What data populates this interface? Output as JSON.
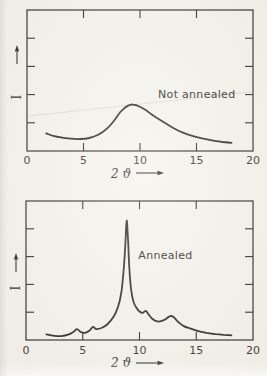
{
  "page": {
    "paper_color": "#f5f3ec",
    "ink_color": "#2b2927",
    "text_color": "#35332e"
  },
  "chart_data": [
    {
      "type": "line",
      "title": "Not annealed",
      "xlabel": "2 ϑ",
      "ylabel": "I",
      "xlim": [
        0,
        20
      ],
      "ylim": [
        0,
        1
      ],
      "grid": false,
      "legend": "none",
      "xticks_labeled": [
        0,
        5,
        10,
        15,
        20
      ],
      "xticks_inner": [
        5,
        10,
        15
      ],
      "ytick_fracs": [
        0.2,
        0.4,
        0.6,
        0.8
      ],
      "annotation": {
        "text": "Not annealed",
        "x": 11.6,
        "y_frac": 0.376
      },
      "points": [
        [
          1.7,
          0.125
        ],
        [
          2.4,
          0.105
        ],
        [
          3.1,
          0.095
        ],
        [
          3.9,
          0.087
        ],
        [
          4.7,
          0.085
        ],
        [
          5.5,
          0.092
        ],
        [
          6.3,
          0.115
        ],
        [
          7.1,
          0.16
        ],
        [
          7.7,
          0.215
        ],
        [
          8.3,
          0.28
        ],
        [
          8.9,
          0.32
        ],
        [
          9.4,
          0.33
        ],
        [
          9.9,
          0.318
        ],
        [
          10.5,
          0.29
        ],
        [
          11.2,
          0.25
        ],
        [
          12.0,
          0.21
        ],
        [
          12.9,
          0.165
        ],
        [
          13.8,
          0.13
        ],
        [
          14.7,
          0.105
        ],
        [
          15.6,
          0.088
        ],
        [
          16.5,
          0.073
        ],
        [
          17.3,
          0.064
        ],
        [
          18.1,
          0.058
        ]
      ]
    },
    {
      "type": "line",
      "title": "Annealed",
      "xlabel": "2 ϑ",
      "ylabel": "I",
      "xlim": [
        0,
        20
      ],
      "ylim": [
        0,
        1
      ],
      "grid": false,
      "legend": "none",
      "xticks_labeled": [
        0,
        5,
        10,
        15,
        20
      ],
      "xticks_inner": [
        5,
        10,
        15
      ],
      "ytick_fracs": [
        0.2,
        0.4,
        0.6,
        0.8
      ],
      "annotation": {
        "text": "Annealed",
        "x": 9.9,
        "y_frac": 0.58
      },
      "points": [
        [
          1.8,
          0.04
        ],
        [
          2.5,
          0.03
        ],
        [
          3.1,
          0.028
        ],
        [
          3.7,
          0.038
        ],
        [
          4.2,
          0.06
        ],
        [
          4.5,
          0.078
        ],
        [
          4.8,
          0.058
        ],
        [
          5.2,
          0.052
        ],
        [
          5.6,
          0.068
        ],
        [
          5.9,
          0.095
        ],
        [
          6.2,
          0.078
        ],
        [
          6.7,
          0.088
        ],
        [
          7.2,
          0.115
        ],
        [
          7.7,
          0.165
        ],
        [
          8.1,
          0.235
        ],
        [
          8.4,
          0.34
        ],
        [
          8.6,
          0.5
        ],
        [
          8.75,
          0.68
        ],
        [
          8.87,
          0.86
        ],
        [
          9.0,
          0.7
        ],
        [
          9.1,
          0.52
        ],
        [
          9.25,
          0.37
        ],
        [
          9.45,
          0.28
        ],
        [
          9.7,
          0.235
        ],
        [
          10.0,
          0.205
        ],
        [
          10.3,
          0.196
        ],
        [
          10.55,
          0.21
        ],
        [
          10.75,
          0.19
        ],
        [
          11.1,
          0.155
        ],
        [
          11.5,
          0.135
        ],
        [
          11.9,
          0.135
        ],
        [
          12.3,
          0.15
        ],
        [
          12.7,
          0.172
        ],
        [
          13.0,
          0.165
        ],
        [
          13.4,
          0.13
        ],
        [
          13.9,
          0.1
        ],
        [
          14.5,
          0.082
        ],
        [
          15.1,
          0.066
        ],
        [
          15.9,
          0.052
        ],
        [
          16.7,
          0.042
        ],
        [
          17.4,
          0.037
        ],
        [
          18.1,
          0.034
        ]
      ]
    }
  ]
}
